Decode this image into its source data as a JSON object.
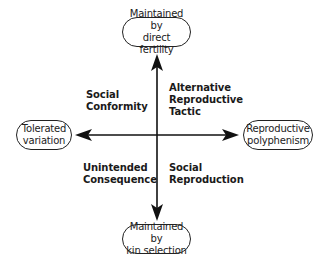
{
  "diagram": {
    "type": "quadrant-axes",
    "nodes": {
      "top": {
        "line1": "Maintained by",
        "line2": "direct fertility"
      },
      "bottom": {
        "line1": "Maintained by",
        "line2": "kin selection"
      },
      "left": {
        "line1": "Tolerated",
        "line2": "variation"
      },
      "right": {
        "line1": "Reproductive",
        "line2": "polyphenism"
      }
    },
    "quadrants": {
      "top_left": {
        "line1": "Social",
        "line2": "Conformity"
      },
      "top_right": {
        "line1": "Alternative",
        "line2": "Reproductive",
        "line3": "Tactic"
      },
      "bottom_left": {
        "line1": "Unintended",
        "line2": "Consequence"
      },
      "bottom_right": {
        "line1": "Social",
        "line2": "Reproduction"
      }
    },
    "colors": {
      "line": "#111111",
      "text": "#1a1a1a",
      "background": "#ffffff"
    }
  }
}
